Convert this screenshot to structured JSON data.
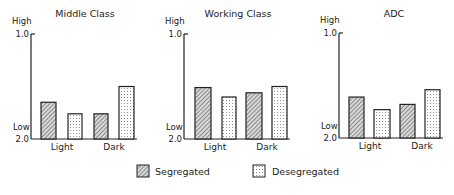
{
  "chart_data": [
    {
      "type": "bar",
      "title": "Middle Class",
      "xlabel": "",
      "ylabel": "",
      "y_top_label": "High",
      "y_bottom_label": "Low",
      "y_ticks": [
        "1.0",
        "2.0"
      ],
      "ylim": [
        2.0,
        1.0
      ],
      "y_inverted": true,
      "categories": [
        "Light",
        "Dark"
      ],
      "series": [
        {
          "name": "Segregated",
          "values": [
            1.65,
            1.76
          ]
        },
        {
          "name": "Desegregated",
          "values": [
            1.76,
            1.5
          ]
        }
      ]
    },
    {
      "type": "bar",
      "title": "Working Class",
      "xlabel": "",
      "ylabel": "",
      "y_top_label": "High",
      "y_bottom_label": "Low",
      "y_ticks": [
        "1.0",
        "2.0"
      ],
      "ylim": [
        2.0,
        1.0
      ],
      "y_inverted": true,
      "categories": [
        "Light",
        "Dark"
      ],
      "series": [
        {
          "name": "Segregated",
          "values": [
            1.51,
            1.56
          ]
        },
        {
          "name": "Desegregated",
          "values": [
            1.6,
            1.5
          ]
        }
      ]
    },
    {
      "type": "bar",
      "title": "ADC",
      "xlabel": "",
      "ylabel": "",
      "y_top_label": "High",
      "y_bottom_label": "Low",
      "y_ticks": [
        "1.0",
        "2.0"
      ],
      "ylim": [
        2.0,
        1.0
      ],
      "y_inverted": true,
      "categories": [
        "Light",
        "Dark"
      ],
      "series": [
        {
          "name": "Segregated",
          "values": [
            1.61,
            1.68
          ]
        },
        {
          "name": "Desegregated",
          "values": [
            1.73,
            1.54
          ]
        }
      ]
    }
  ],
  "legend": {
    "position": "bottom-center",
    "items": [
      {
        "label": "Segregated",
        "pattern": "diagonal-hatch"
      },
      {
        "label": "Desegregated",
        "pattern": "dots"
      }
    ]
  },
  "colors": {
    "ink": "#222222",
    "background": "#ffffff"
  }
}
